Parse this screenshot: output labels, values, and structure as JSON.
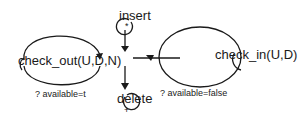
{
  "diagram": {
    "nodes": {
      "insert": {
        "label": "insert",
        "marker": "*"
      },
      "delete": {
        "label": "delete",
        "marker": "+"
      },
      "check_out": {
        "label": "check_out(U,D,N)"
      },
      "check_in": {
        "label": "check_in(U,D)"
      }
    },
    "guards": {
      "left": "? available=t",
      "right": "? available=false"
    },
    "colors": {
      "stroke": "#1a1a1a",
      "background": "#ffffff"
    }
  }
}
